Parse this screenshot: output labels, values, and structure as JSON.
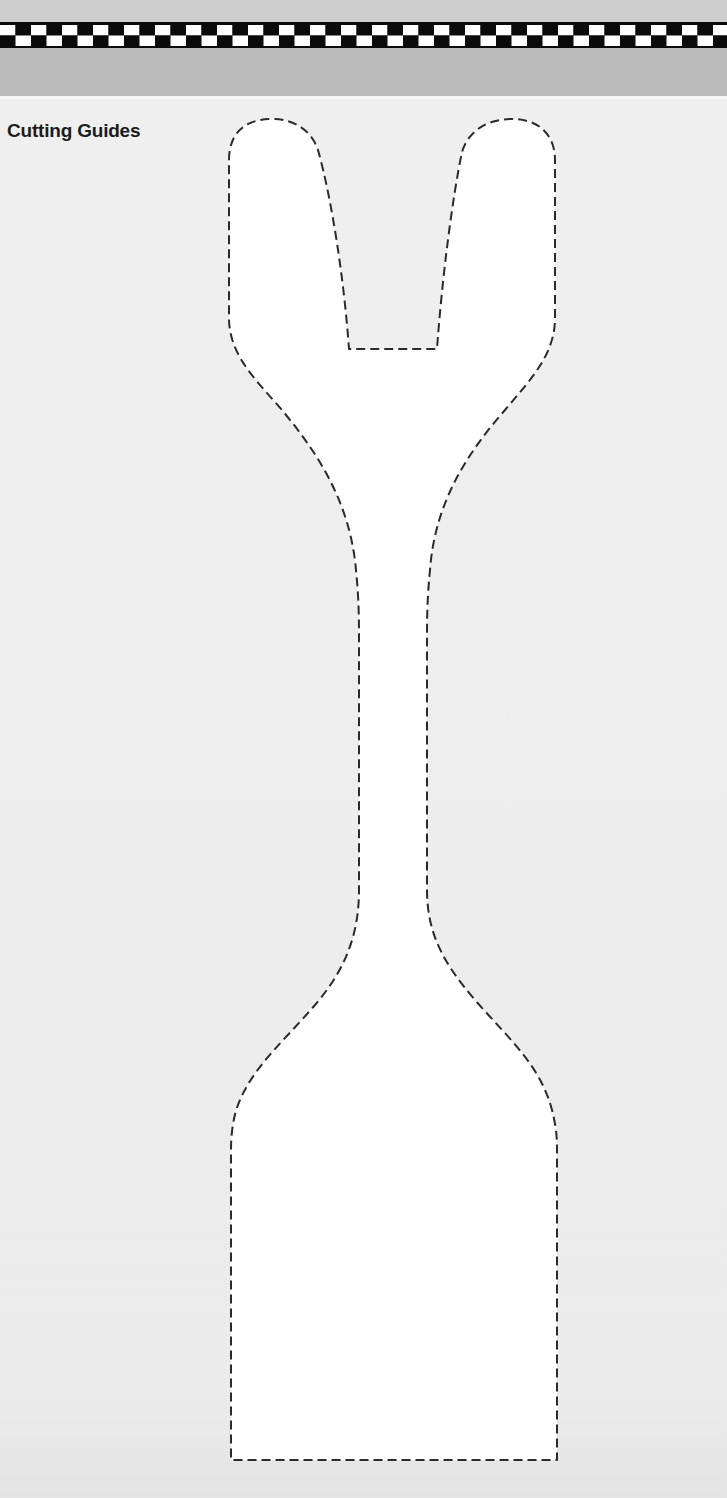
{
  "header": {
    "pattern": "checkered-border",
    "colors": {
      "top_margin": "#cdcdcd",
      "checker_dark": "#0a0a0a",
      "checker_light": "#ffffff",
      "band": "#b9b9b9",
      "page": "#ececec"
    }
  },
  "section": {
    "title": "Cutting Guides"
  },
  "template": {
    "shape": "tuning-fork-paddle",
    "outline_style": "dashed",
    "outline_color": "#2a2a2a",
    "fill_color": "#ffffff"
  }
}
